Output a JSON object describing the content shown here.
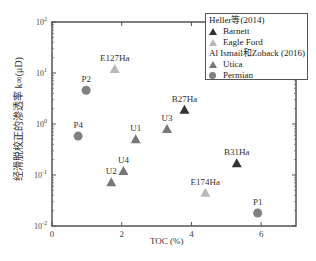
{
  "chart_data": {
    "type": "scatter",
    "title": "",
    "xlabel": "TOC (%)",
    "ylabel": "经滑脱校正的渗透率 k∞(μD)",
    "xlim": [
      0,
      7
    ],
    "ylim": [
      0.01,
      100
    ],
    "yscale": "log",
    "x_ticks": [
      "0",
      "2",
      "4",
      "6"
    ],
    "y_ticks": [
      "10^-2",
      "10^-1",
      "10^0",
      "10^1",
      "10^2"
    ],
    "grid": false,
    "legend_position": "upper right",
    "legend": {
      "groups": [
        {
          "title": "Heller等(2014)",
          "entries": [
            {
              "name": "Barnett",
              "marker": "triangle",
              "color": "#333333"
            },
            {
              "name": "Eagle Ford",
              "marker": "triangle",
              "color": "#b8b8b8"
            }
          ]
        },
        {
          "title": "Al Ismail和Zoback (2016)",
          "entries": [
            {
              "name": "Utica",
              "marker": "triangle",
              "color": "#777777"
            },
            {
              "name": "Permian",
              "marker": "circle",
              "color": "#808080"
            }
          ]
        }
      ]
    },
    "series": [
      {
        "name": "Barnett",
        "marker": "triangle",
        "color": "#333333",
        "points": [
          {
            "label": "B27Ha",
            "x": 3.8,
            "y": 1.9
          },
          {
            "label": "B31Ha",
            "x": 5.3,
            "y": 0.17
          }
        ]
      },
      {
        "name": "Eagle Ford",
        "marker": "triangle",
        "color": "#b8b8b8",
        "points": [
          {
            "label": "E127Ha",
            "x": 1.8,
            "y": 12
          },
          {
            "label": "E174Ha",
            "x": 4.4,
            "y": 0.045
          }
        ]
      },
      {
        "name": "Utica",
        "marker": "triangle",
        "color": "#777777",
        "points": [
          {
            "label": "U1",
            "x": 2.4,
            "y": 0.5
          },
          {
            "label": "U2",
            "x": 1.7,
            "y": 0.072
          },
          {
            "label": "U3",
            "x": 3.3,
            "y": 0.8
          },
          {
            "label": "U4",
            "x": 2.05,
            "y": 0.12
          }
        ]
      },
      {
        "name": "Permian",
        "marker": "circle",
        "color": "#808080",
        "points": [
          {
            "label": "P1",
            "x": 5.9,
            "y": 0.018
          },
          {
            "label": "P2",
            "x": 0.98,
            "y": 4.6
          },
          {
            "label": "P4",
            "x": 0.75,
            "y": 0.58
          }
        ]
      }
    ]
  },
  "labels": {
    "ylabel": "经滑脱校正的渗透率 k∞(μD)",
    "xlabel": "TOC (%)",
    "legend_group1": "Heller等(2014)",
    "legend_barnett": "Barnett",
    "legend_eagleford": "Eagle Ford",
    "legend_group2": "Al Ismail和Zoback (2016)",
    "legend_utica": "Utica",
    "legend_permian": "Permian"
  }
}
